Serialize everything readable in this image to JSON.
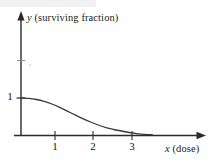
{
  "figure": {
    "background_color": "#ffffff",
    "ink_color": "#2b2b2b"
  },
  "chart_data": {
    "type": "line",
    "title": "",
    "xlabel_var": "x",
    "xlabel_text": " (dose)",
    "ylabel_var": "y",
    "ylabel_text": " (surviving fraction)",
    "xlabel": "x (dose)",
    "ylabel": "y (surviving fraction)",
    "xlim": [
      0,
      4.7
    ],
    "ylim": [
      0,
      2.4
    ],
    "xticks": [
      1,
      2,
      3
    ],
    "xtick_labels": [
      "1",
      "2",
      "3"
    ],
    "yticks": [
      1,
      1.95
    ],
    "ytick_labels": [
      "1",
      ""
    ],
    "grid": false,
    "legend": null,
    "annotations": [],
    "series": [
      {
        "name": "surviving fraction",
        "color": "#3a3a3a",
        "x": [
          0.0,
          0.2,
          0.4,
          0.6,
          0.8,
          1.0,
          1.2,
          1.4,
          1.6,
          1.8,
          2.0,
          2.2,
          2.4,
          2.6,
          2.8,
          3.0,
          3.2,
          3.4
        ],
        "values": [
          1.0,
          0.99,
          0.96,
          0.91,
          0.84,
          0.75,
          0.65,
          0.55,
          0.45,
          0.36,
          0.28,
          0.21,
          0.16,
          0.12,
          0.08,
          0.05,
          0.03,
          0.02
        ]
      }
    ]
  },
  "labels": {
    "y_axis": {
      "var": "y",
      "text": " (surviving fraction)"
    },
    "x_axis": {
      "var": "x",
      "text": " (dose)"
    },
    "y_tick_1": "1",
    "x_tick_1": "1",
    "x_tick_2": "2",
    "x_tick_3": "3"
  }
}
